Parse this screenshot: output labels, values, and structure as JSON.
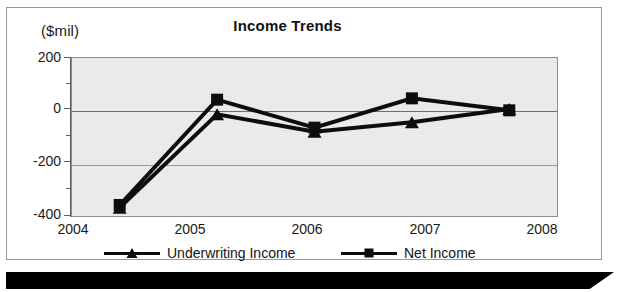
{
  "chart_data": {
    "type": "line",
    "title": "Income Trends",
    "unit_label": "($mil)",
    "xlabel": "",
    "ylabel": "($mil)",
    "categories": [
      "2004",
      "2005",
      "2006",
      "2007",
      "2008"
    ],
    "ylim": [
      -400,
      200
    ],
    "yticks": [
      200,
      0,
      -200,
      -400
    ],
    "ytick_labels": [
      "200",
      "0",
      "-200",
      "-400"
    ],
    "yminor_step": 100,
    "grid": true,
    "legend_position": "bottom",
    "plot_background": "#e2e2e2",
    "series": [
      {
        "name": "Underwriting Income",
        "marker": "triangle",
        "color": "#0d0d0d",
        "values": [
          -365,
          -15,
          -80,
          -45,
          5
        ]
      },
      {
        "name": "Net Income",
        "marker": "square",
        "color": "#0d0d0d",
        "values": [
          -355,
          40,
          -65,
          45,
          0
        ]
      }
    ]
  },
  "page": {
    "border_color": "#9a9a9a",
    "band_color": "#000000"
  }
}
